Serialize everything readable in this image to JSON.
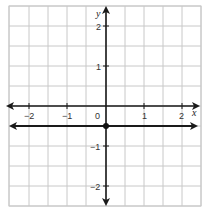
{
  "chart_data": {
    "type": "line",
    "title": "",
    "xlabel": "x",
    "ylabel": "y",
    "xlim": [
      -2.5,
      2.5
    ],
    "ylim": [
      -2.5,
      2.5
    ],
    "grid": true,
    "grid_step": 0.5,
    "x_ticks": [
      -2,
      -1,
      0,
      1,
      2
    ],
    "x_tick_labels": [
      "−2",
      "−1",
      "0",
      "1",
      "2"
    ],
    "y_ticks": [
      -2,
      -1,
      1,
      2
    ],
    "y_tick_labels": [
      "−2",
      "−1",
      "1",
      "2"
    ],
    "origin_label": "0",
    "series": [
      {
        "name": "horizontal line",
        "equation": "y = -0.5",
        "x": [
          -2.5,
          2.5
        ],
        "y": [
          -0.5,
          -0.5
        ],
        "arrows": "both"
      }
    ],
    "points": [
      {
        "x": 0,
        "y": -0.5,
        "style": "filled"
      }
    ],
    "colors": {
      "grid": "#c8c8c8",
      "axis": "#1a1a1a",
      "line": "#1a1a1a",
      "point": "#111111",
      "background": "#ffffff"
    }
  },
  "labels": {
    "x_axis": "x",
    "y_axis": "y",
    "origin": "0",
    "x_tick_neg2": "−2",
    "x_tick_neg1": "−1",
    "x_tick_1": "1",
    "x_tick_2": "2",
    "y_tick_2": "2",
    "y_tick_1": "1",
    "y_tick_neg1": "−1",
    "y_tick_neg2": "−2"
  }
}
